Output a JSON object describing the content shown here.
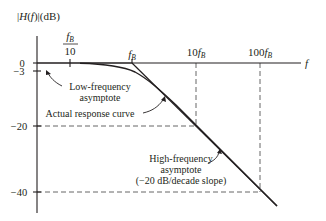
{
  "diagram": {
    "y_axis": {
      "label_prefix": "|",
      "label_H": "H",
      "label_open": "(",
      "label_f": "f",
      "label_close": ")|",
      "label_unit": "(dB)",
      "ticks": [
        {
          "label": "0",
          "value": 0
        },
        {
          "label": "−3",
          "value": -3
        },
        {
          "label": "−20",
          "value": -20
        },
        {
          "label": "−40",
          "value": -40
        }
      ]
    },
    "x_axis": {
      "label": "f",
      "ticks": [
        {
          "num": "f",
          "sub": "B",
          "den": "10",
          "label": "fB/10"
        },
        {
          "coef": "",
          "var": "f",
          "sub": "B",
          "label": "fB"
        },
        {
          "coef": "10",
          "var": "f",
          "sub": "B",
          "label": "10fB"
        },
        {
          "coef": "100",
          "var": "f",
          "sub": "B",
          "label": "100fB"
        }
      ]
    },
    "annotations": {
      "low_freq_line1": "Low-frequency",
      "low_freq_line2": "asymptote",
      "actual_curve": "Actual response curve",
      "high_freq_line1": "High-frequency",
      "high_freq_line2": "asymptote",
      "high_freq_line3": "(−20 dB/decade slope)"
    },
    "colors": {
      "line": "#231f20",
      "dash": "#555555",
      "background": "#ffffff"
    }
  }
}
